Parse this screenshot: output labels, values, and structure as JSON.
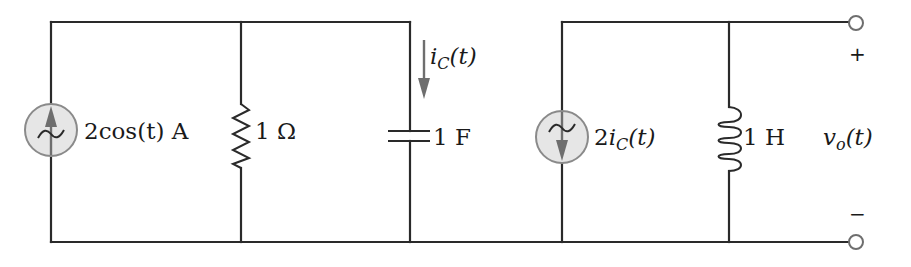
{
  "circuit": {
    "independent_source": {
      "type": "ac-current-source",
      "direction": "up",
      "label": "2cos(t) A"
    },
    "resistor": {
      "value_label": "1 Ω"
    },
    "capacitor": {
      "value_label": "1 F",
      "current_label_main": "i",
      "current_label_sub": "C",
      "current_label_arg": "(t)",
      "current_direction": "down"
    },
    "dependent_source": {
      "type": "ac-dependent-current-source",
      "direction": "down",
      "label_coef": "2",
      "label_main": "i",
      "label_sub": "C",
      "label_arg": "(t)"
    },
    "inductor": {
      "value_label": "1 H"
    },
    "output": {
      "label_main": "v",
      "label_sub": "o",
      "label_arg": "(t)",
      "plus_sign": "+",
      "minus_sign": "−"
    }
  },
  "colors": {
    "wire": "#2a2a2a",
    "source_fill": "#e6e6e6",
    "source_stroke": "#8a8a8a",
    "arrow": "#6e6e6e"
  }
}
